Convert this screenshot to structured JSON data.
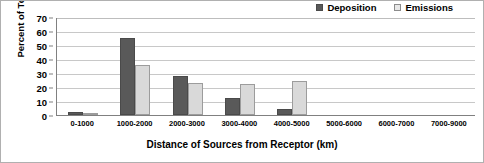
{
  "chart_data": {
    "type": "bar",
    "title": "",
    "xlabel": "Distance of Sources from Receptor (km)",
    "ylabel": "Percent of Total",
    "categories": [
      "0-1000",
      "1000-2000",
      "2000-3000",
      "3000-4000",
      "4000-5000",
      "5000-6000",
      "6000-7000",
      "7000-9000"
    ],
    "series": [
      {
        "name": "Deposition",
        "color": "#595959",
        "values": [
          2,
          55,
          28,
          12,
          4,
          0,
          0,
          0
        ]
      },
      {
        "name": "Emissions",
        "color": "#d9d9d9",
        "values": [
          0.5,
          36,
          23,
          22,
          24,
          0,
          0,
          0
        ]
      }
    ],
    "ylim": [
      0,
      70
    ],
    "yticks": [
      0,
      10,
      20,
      30,
      40,
      50,
      60,
      70
    ],
    "grid": true,
    "legend_position": "top-right"
  },
  "legend": {
    "entries": [
      {
        "label": "Deposition"
      },
      {
        "label": "Emissions"
      }
    ]
  }
}
